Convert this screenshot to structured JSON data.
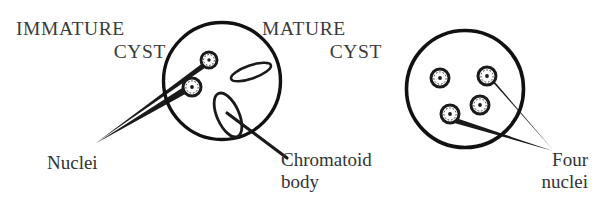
{
  "figure": {
    "title_immature": "IMMATURE",
    "title_immature_line2": "CYST",
    "title_mature": "MATURE",
    "title_mature_line2": "CYST",
    "label_nuclei": "Nuclei",
    "label_chromatoid_line1": "Chromatoid",
    "label_chromatoid_line2": "body",
    "label_four_line1": "Four",
    "label_four_line2": "nuclei",
    "ink_color": "#1a1a1a",
    "background_color": "#ffffff",
    "text_color": "#333333"
  },
  "diagram_data": {
    "type": "diagram",
    "subject": "Entamoeba cyst maturation comparison",
    "panels": [
      {
        "name": "immature-cyst",
        "title": "IMMATURE CYST",
        "cyst": {
          "cx": 222,
          "cy": 81,
          "r": 59
        },
        "nuclei_count": 2,
        "nuclei": [
          {
            "cx": 209,
            "cy": 60,
            "r": 7.5
          },
          {
            "cx": 192,
            "cy": 87,
            "r": 8.5
          }
        ],
        "chromatoid_bodies": [
          {
            "cx": 251,
            "cy": 72,
            "rx": 21,
            "ry": 6.5,
            "rotation": -18
          },
          {
            "cx": 228,
            "cy": 115,
            "rx": 23,
            "ry": 11,
            "rotation": 65
          }
        ],
        "callouts": [
          {
            "label": "Nuclei",
            "tip": [
              96,
              142
            ],
            "targets": [
              [
                209,
                60
              ],
              [
                192,
                87
              ]
            ]
          },
          {
            "label": "Chromatoid body",
            "from": [
              228,
              115
            ],
            "to": [
              286,
              157
            ]
          }
        ]
      },
      {
        "name": "mature-cyst",
        "title": "MATURE CYST",
        "cyst": {
          "cx": 465,
          "cy": 89,
          "r": 59
        },
        "nuclei_count": 4,
        "nuclei": [
          {
            "cx": 440,
            "cy": 78,
            "r": 8.5
          },
          {
            "cx": 487,
            "cy": 76,
            "r": 8.5
          },
          {
            "cx": 480,
            "cy": 105,
            "r": 8.5
          },
          {
            "cx": 450,
            "cy": 114,
            "r": 8.5
          }
        ],
        "chromatoid_bodies": [],
        "callouts": [
          {
            "label": "Four nuclei",
            "tip": [
              553,
              150
            ],
            "targets": [
              [
                487,
                76
              ],
              [
                450,
                114
              ]
            ]
          }
        ]
      }
    ]
  }
}
